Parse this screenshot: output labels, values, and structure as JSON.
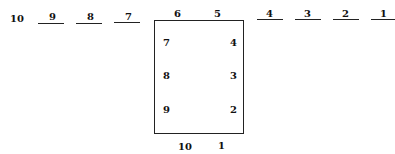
{
  "diagram": {
    "top_row": [
      {
        "label": "10",
        "x": 10,
        "underline": false
      },
      {
        "label": "9",
        "x": 48,
        "underline": true,
        "line_x": 38,
        "line_w": 26
      },
      {
        "label": "8",
        "x": 86,
        "underline": true,
        "line_x": 76,
        "line_w": 26
      },
      {
        "label": "7",
        "x": 124,
        "underline": true,
        "line_x": 114,
        "line_w": 26
      },
      {
        "label": "6",
        "x": 176,
        "underline": false
      },
      {
        "label": "5",
        "x": 215,
        "underline": false
      },
      {
        "label": "4",
        "x": 264,
        "underline": true,
        "line_x": 254,
        "line_w": 26
      },
      {
        "label": "3",
        "x": 302,
        "underline": true,
        "line_x": 292,
        "line_w": 26
      },
      {
        "label": "2",
        "x": 340,
        "underline": true,
        "line_x": 330,
        "line_w": 26
      },
      {
        "label": "1",
        "x": 378,
        "underline": true,
        "line_x": 368,
        "line_w": 26
      }
    ],
    "box_left": [
      "7",
      "8",
      "9"
    ],
    "box_right": [
      "4",
      "3",
      "2"
    ],
    "bottom": [
      "10",
      "1"
    ]
  }
}
